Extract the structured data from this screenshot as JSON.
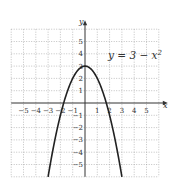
{
  "chart_data": {
    "type": "line",
    "title": "",
    "equation_label": "y = 3 − x",
    "equation_exponent": "2",
    "function": "y = 3 - x^2",
    "xlabel": "x",
    "ylabel": "y",
    "xlim": [
      -6,
      6
    ],
    "ylim": [
      -6,
      6
    ],
    "grid": true,
    "x_ticks": [
      -5,
      -4,
      -3,
      -2,
      -1,
      1,
      2,
      3,
      4,
      5
    ],
    "y_ticks": [
      -5,
      -4,
      -3,
      -2,
      -1,
      1,
      2,
      3,
      4,
      5
    ],
    "x_tick_labels": [
      "−5",
      "−4",
      "−3",
      "−2",
      "−1",
      "1",
      "2",
      "3",
      "4",
      "5"
    ],
    "y_tick_labels": [
      "−5",
      "−4",
      "−3",
      "−2",
      "−1",
      "1",
      "2",
      "3",
      "4",
      "5"
    ],
    "series": [
      {
        "name": "y = 3 - x^2",
        "x": [
          -3,
          -2.5,
          -2,
          -1.5,
          -1,
          -0.5,
          0,
          0.5,
          1,
          1.5,
          2,
          2.5,
          3
        ],
        "y": [
          -6,
          -3.25,
          -1,
          0.75,
          2,
          2.75,
          3,
          2.75,
          2,
          0.75,
          -1,
          -3.25,
          -6
        ]
      }
    ]
  },
  "colors": {
    "curve": "#222222",
    "grid": "#999999",
    "axis": "#333333"
  }
}
